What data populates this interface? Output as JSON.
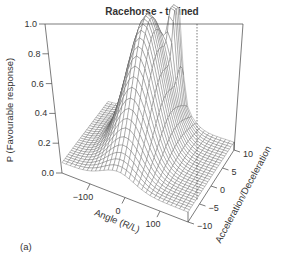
{
  "chart_data": {
    "type": "surface3d",
    "title": "Racehorse - trained",
    "panel_label": "(a)",
    "xlabel": "Angle (R/L)",
    "ylabel": "Acceleration/Deceleration",
    "zlabel": "P (Favourable response)",
    "xlim": [
      -180,
      180
    ],
    "ylim": [
      -10,
      10
    ],
    "zlim": [
      0.0,
      1.0
    ],
    "x_ticks": [
      -100,
      0,
      100
    ],
    "y_ticks": [
      -10,
      -5,
      0,
      5,
      10
    ],
    "z_ticks": [
      "0.0",
      "0.2",
      "0.4",
      "0.6",
      "0.8",
      "1.0"
    ],
    "surface_baseline": 0.07,
    "peaks": [
      {
        "name": "main peak",
        "angle": -20,
        "accel": 3,
        "height": 1.0,
        "sd_angle": 45,
        "sd_accel": 6
      },
      {
        "name": "secondary peak",
        "angle": 20,
        "accel": 9,
        "height": 0.9,
        "sd_angle": 10,
        "sd_accel": 1.5
      }
    ],
    "grid_resolution": 30,
    "line_color": "#555555"
  }
}
